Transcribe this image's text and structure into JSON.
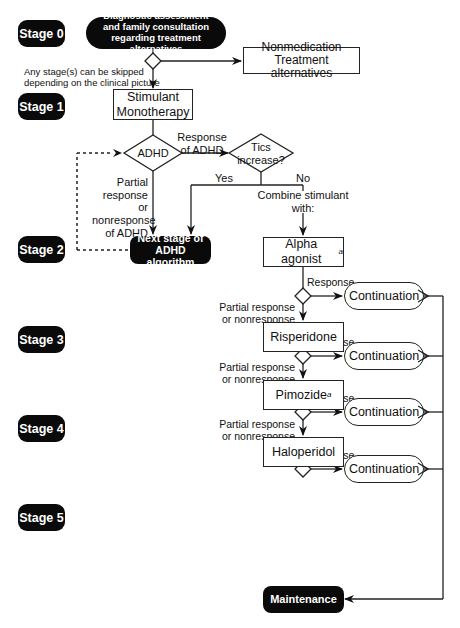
{
  "diagram": {
    "stages": [
      {
        "id": "stage-0",
        "label": "Stage 0"
      },
      {
        "id": "stage-1",
        "label": "Stage 1"
      },
      {
        "id": "stage-2",
        "label": "Stage 2"
      },
      {
        "id": "stage-3",
        "label": "Stage 3"
      },
      {
        "id": "stage-4",
        "label": "Stage 4"
      },
      {
        "id": "stage-5",
        "label": "Stage 5"
      }
    ],
    "nodes": {
      "diagnostic": "Diagnostic assessment and family consultation regarding treatment alternatives",
      "nonmedication_line1": "Nonmedication",
      "nonmedication_line2": "Treatment alternatives",
      "stimulant_line1": "Stimulant",
      "stimulant_line2": "Monotherapy",
      "adhd_decision": "ADHD",
      "tics_line1": "Tics",
      "tics_line2": "increase?",
      "next_stage_line1": "Next stage of",
      "next_stage_line2": "ADHD algorithm",
      "alpha_agonist": "Alpha agonist",
      "alpha_agonist_footnote": "a",
      "risperidone": "Risperidone",
      "pimozide": "Pimozide",
      "pimozide_footnote": "a",
      "haloperidol": "Haloperidol",
      "continuation": "Continuation",
      "maintenance": "Maintenance"
    },
    "labels": {
      "skip_note_line1": "Any stage(s) can be skipped",
      "skip_note_line2": "depending on the clinical picture",
      "response_of_adhd_line1": "Response",
      "response_of_adhd_line2": "of ADHD",
      "partial_adhd_line1": "Partial",
      "partial_adhd_line2": "response or",
      "partial_adhd_line3": "nonresponse",
      "partial_adhd_line4": "of ADHD",
      "yes": "Yes",
      "no": "No",
      "combine": "Combine stimulant with:",
      "response": "Response",
      "partial_line1": "Partial response",
      "partial_line2": "or nonresponse"
    },
    "colors": {
      "dark_fill": "#0a0a0a",
      "line": "#222222",
      "background": "#ffffff"
    }
  }
}
